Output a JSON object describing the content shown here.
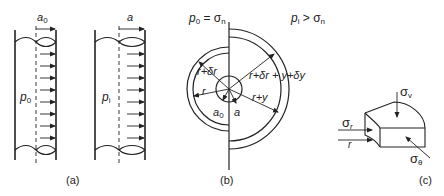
{
  "figure": {
    "panels": [
      {
        "id": "a",
        "caption": "(a)",
        "tubes": [
          {
            "pressure_label": "p",
            "pressure_sub": "0",
            "radius_label": "a",
            "radius_sub": "0"
          },
          {
            "pressure_label": "p",
            "pressure_sub": "i",
            "radius_label": "a",
            "radius_sub": ""
          }
        ]
      },
      {
        "id": "b",
        "caption": "(b)",
        "left_condition": {
          "lhs": "p",
          "lhs_sub": "0",
          "eq": " = ",
          "rhs": "σ",
          "rhs_sub": "n"
        },
        "right_condition": {
          "lhs": "p",
          "lhs_sub": "i",
          "op": " > ",
          "rhs": "σ",
          "rhs_sub": "n"
        },
        "labels": {
          "r_plus_dr": "r+δr",
          "r": "r",
          "a0": "a",
          "a0_sub": "0",
          "a": "a",
          "r_plus_y": "r+y",
          "r_dr_y_dy": "r+δr + y+δy"
        }
      },
      {
        "id": "c",
        "caption": "(c)",
        "labels": {
          "sigma_v": "σ",
          "sigma_v_sub": "v",
          "sigma_r": "σ",
          "sigma_r_sub": "r",
          "r": "r",
          "sigma_theta": "σ",
          "sigma_theta_sub": "θ"
        }
      }
    ]
  }
}
